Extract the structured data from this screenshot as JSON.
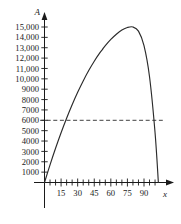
{
  "chart_data": {
    "type": "line",
    "title": "",
    "subtitle": "",
    "xlabel": "x",
    "ylabel": "A",
    "xlim": [
      -6,
      108
    ],
    "ylim": [
      0,
      15800
    ],
    "grid": false,
    "legend": null,
    "y_ticks": [
      1000,
      2000,
      3000,
      4000,
      5000,
      6000,
      7000,
      8000,
      9000,
      10000,
      11000,
      12000,
      13000,
      14000,
      15000
    ],
    "y_tick_labels": [
      "1000",
      "2000",
      "3000",
      "4000",
      "5000",
      "6000",
      "7000",
      "8000",
      "9000",
      "10,000",
      "11,000",
      "12,000",
      "13,000",
      "14,000",
      "15,000"
    ],
    "x_ticks_major": [
      15,
      30,
      45,
      60,
      75,
      90
    ],
    "x_tick_labels": [
      "15",
      "30",
      "45",
      "60",
      "75",
      "90"
    ],
    "x_ticks_minor_start": 5,
    "x_ticks_minor_end": 100,
    "x_ticks_minor_step": 5,
    "series": [
      {
        "name": "A(x)",
        "style": "solid",
        "color": "#2b2b2b",
        "x": [
          0,
          5,
          10,
          15,
          20,
          25,
          30,
          35,
          40,
          45,
          50,
          52.5,
          55,
          60,
          65,
          70,
          75,
          80,
          85,
          90,
          95,
          100,
          103
        ],
        "values": [
          0,
          1700,
          3300,
          4800,
          6200,
          7500,
          8700,
          9800,
          10800,
          11700,
          12500,
          12850,
          13200,
          13800,
          14300,
          14700,
          14950,
          15000,
          14600,
          13200,
          10200,
          4800,
          0
        ]
      }
    ],
    "annotations": [
      {
        "type": "horizontal-reference-line",
        "name": "area-6000-line",
        "value": 6000,
        "label": "6000",
        "style": "dashed",
        "color": "#2b2b2b",
        "x_start": -4,
        "x_end": 107
      }
    ],
    "peak": {
      "x": 80,
      "y": 15000
    },
    "x_intercepts": [
      0,
      103
    ]
  }
}
